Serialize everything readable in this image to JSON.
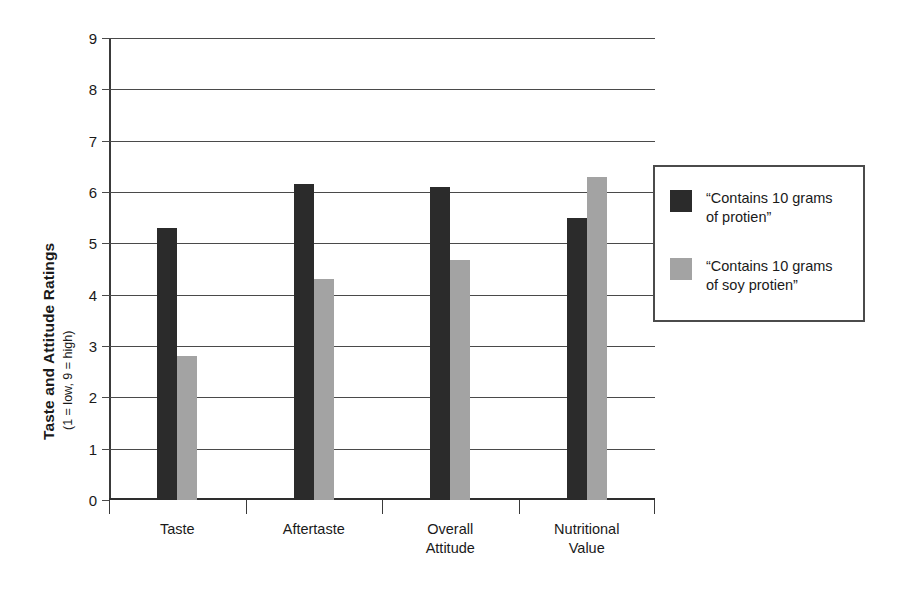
{
  "chart_data": {
    "type": "bar",
    "title": "",
    "xlabel": "",
    "ylabel": "Taste and Attitude Ratings",
    "ylabel_sub": "(1 = low, 9 = high)",
    "categories": [
      "Taste",
      "Aftertaste",
      "Overall\nAttitude",
      "Nutritional\nValue"
    ],
    "series": [
      {
        "name": "“Contains 10 grams\nof protien”",
        "color": "#2b2b2b",
        "values": [
          5.3,
          6.15,
          6.1,
          5.5
        ]
      },
      {
        "name": "“Contains 10 grams\nof soy protien”",
        "color": "#a3a3a3",
        "values": [
          2.8,
          4.3,
          4.67,
          6.3
        ]
      }
    ],
    "ylim": [
      0,
      9
    ],
    "yticks": [
      0,
      1,
      2,
      3,
      4,
      5,
      6,
      7,
      8,
      9
    ],
    "ytick_labels": [
      "0",
      "1",
      "2",
      "3",
      "4",
      "5",
      "6",
      "7",
      "8",
      "9"
    ],
    "grid": true,
    "legend_position": "right"
  },
  "legend": {
    "entries": [
      "“Contains 10 grams\nof protien”",
      "“Contains 10 grams\nof soy protien”"
    ]
  }
}
